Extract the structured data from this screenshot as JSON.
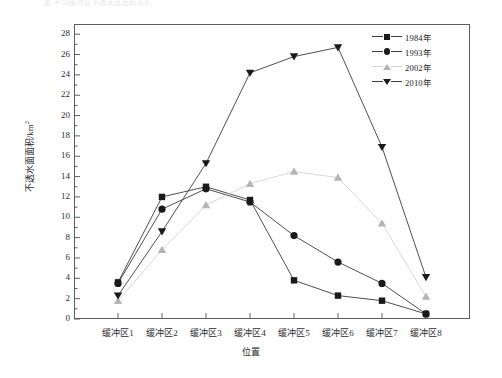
{
  "caption": {
    "top_text": "图  不同缓冲区不透水面面积变化"
  },
  "chart_data": {
    "type": "line",
    "title": "",
    "xlabel": "位置",
    "ylabel": "不透水面面积/km",
    "ylabel_sup": "2",
    "categories": [
      "缓冲区1",
      "缓冲区2",
      "缓冲区3",
      "缓冲区4",
      "缓冲区5",
      "缓冲区6",
      "缓冲区7",
      "缓冲区8"
    ],
    "ylim": [
      0,
      29
    ],
    "yticks": [
      0,
      2,
      4,
      6,
      8,
      10,
      12,
      14,
      16,
      18,
      20,
      22,
      24,
      26,
      28
    ],
    "ytick_labels": [
      "0",
      "2",
      "4",
      "6",
      "8",
      "10",
      "12",
      "14",
      "16",
      "18",
      "20",
      "22",
      "24",
      "26",
      "28"
    ],
    "grid": false,
    "legend_position": "top-right",
    "series": [
      {
        "name": "1984年",
        "marker": "square",
        "color": "#1a1a1d",
        "line_color": "#3a3a3f",
        "values": [
          3.6,
          12.0,
          13.0,
          11.7,
          3.8,
          2.3,
          1.8,
          0.5
        ]
      },
      {
        "name": "1993年",
        "marker": "circle",
        "color": "#1a1a1d",
        "line_color": "#3a3a3f",
        "values": [
          3.5,
          10.8,
          12.8,
          11.5,
          8.2,
          5.6,
          3.5,
          0.5
        ]
      },
      {
        "name": "2002年",
        "marker": "triangle-up",
        "color": "#b4b4b4",
        "line_color": "#d2d2d2",
        "values": [
          1.8,
          6.8,
          11.2,
          13.3,
          14.5,
          13.9,
          9.4,
          2.2
        ]
      },
      {
        "name": "2010年",
        "marker": "triangle-down",
        "color": "#1a1a1d",
        "line_color": "#3a3a3f",
        "values": [
          2.3,
          8.6,
          15.3,
          24.2,
          25.8,
          26.7,
          16.9,
          4.1
        ]
      }
    ]
  },
  "legend": {
    "items": [
      {
        "label": "1984年",
        "marker": "square-marker"
      },
      {
        "label": "1993年",
        "marker": "circle-marker"
      },
      {
        "label": "2002年",
        "marker": "triangle-up-marker"
      },
      {
        "label": "2010年",
        "marker": "triangle-down-marker"
      }
    ]
  }
}
